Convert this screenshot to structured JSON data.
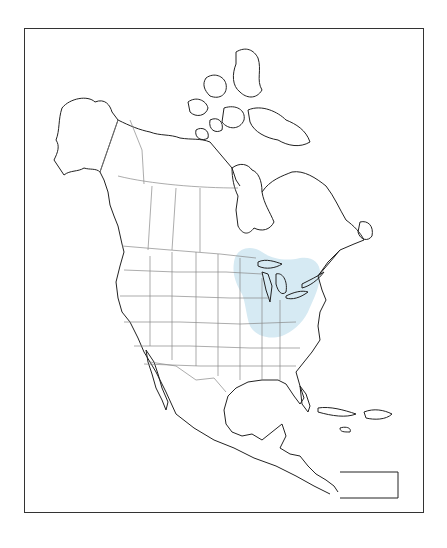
{
  "map": {
    "type": "outline map",
    "region": "North America",
    "highlight": {
      "area": "Great Lakes region",
      "color": "#d6eaf3"
    },
    "outline_color": "#222222",
    "boundary_color": "#888888",
    "background": "#ffffff"
  }
}
